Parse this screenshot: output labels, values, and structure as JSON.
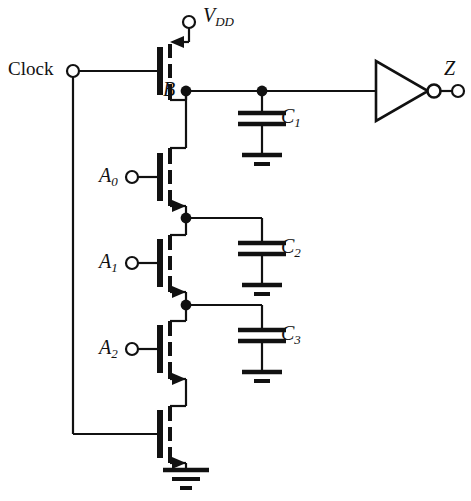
{
  "figure": {
    "type": "schematic",
    "background_color": "#ffffff",
    "line_color": "#111111"
  },
  "terminals": [
    {
      "id": "vdd",
      "label": "V",
      "subscript": "DD",
      "kind": "supply-terminal",
      "x": 189,
      "y": 22,
      "label_x": 203,
      "label_y": 6
    },
    {
      "id": "clock",
      "label": "Clock",
      "subscript": "",
      "kind": "input-terminal",
      "x": 73,
      "y": 71,
      "label_x": 8,
      "label_y": 59
    },
    {
      "id": "a0",
      "label": "A",
      "subscript": "0",
      "kind": "input-terminal",
      "x": 132,
      "y": 177,
      "label_x": 99,
      "label_y": 165
    },
    {
      "id": "a1",
      "label": "A",
      "subscript": "1",
      "kind": "input-terminal",
      "x": 132,
      "y": 263,
      "label_x": 99,
      "label_y": 251
    },
    {
      "id": "a2",
      "label": "A",
      "subscript": "2",
      "kind": "input-terminal",
      "x": 132,
      "y": 349,
      "label_x": 99,
      "label_y": 337
    },
    {
      "id": "z",
      "label": "Z",
      "subscript": "",
      "kind": "output-terminal",
      "x": 458,
      "y": 91,
      "label_x": 444,
      "label_y": 60
    }
  ],
  "nodes": [
    {
      "id": "node-b",
      "label": "B",
      "x": 186,
      "y": 91,
      "label_x": 164,
      "label_y": 80
    },
    {
      "id": "node-c1-tap",
      "label": "",
      "x": 262,
      "y": 91
    },
    {
      "id": "node-n1",
      "label": "",
      "x": 186,
      "y": 218
    },
    {
      "id": "node-n2",
      "label": "",
      "x": 186,
      "y": 305
    }
  ],
  "transistors": [
    {
      "id": "m-precharge",
      "type": "PMOS",
      "gate_net": "Clock",
      "drain_net": "VDD",
      "source_net": "B",
      "gate_bar_x": 160,
      "gate_center_y": 71,
      "arrow_direction": "into-device-top"
    },
    {
      "id": "m-a0",
      "type": "NMOS",
      "gate_net": "A0",
      "drain_net": "B",
      "source_net": "N1",
      "gate_bar_x": 160,
      "gate_center_y": 177,
      "arrow_direction": "out-of-device-bottom"
    },
    {
      "id": "m-a1",
      "type": "NMOS",
      "gate_net": "A1",
      "drain_net": "N1",
      "source_net": "N2",
      "gate_bar_x": 160,
      "gate_center_y": 263,
      "arrow_direction": "out-of-device-bottom"
    },
    {
      "id": "m-a2",
      "type": "NMOS",
      "gate_net": "A2",
      "drain_net": "N2",
      "source_net": "N3",
      "gate_bar_x": 160,
      "gate_center_y": 349,
      "arrow_direction": "out-of-device-bottom"
    },
    {
      "id": "m-footer",
      "type": "NMOS",
      "gate_net": "Clock",
      "drain_net": "N3",
      "source_net": "GND",
      "gate_bar_x": 160,
      "gate_center_y": 434,
      "arrow_direction": "out-of-device-bottom"
    }
  ],
  "capacitors": [
    {
      "id": "c1",
      "label": "C",
      "subscript": "1",
      "x": 262,
      "plate_top_y": 113,
      "plate_bottom_y": 124,
      "ground_y": 155,
      "label_x": 279,
      "label_y": 107
    },
    {
      "id": "c2",
      "label": "C",
      "subscript": "2",
      "x": 262,
      "plate_top_y": 243,
      "plate_bottom_y": 254,
      "ground_y": 285,
      "label_x": 279,
      "label_y": 238
    },
    {
      "id": "c3",
      "label": "C",
      "subscript": "3",
      "x": 262,
      "plate_top_y": 330,
      "plate_bottom_y": 341,
      "ground_y": 372,
      "label_x": 279,
      "label_y": 325
    }
  ],
  "gates": [
    {
      "id": "output-inverter",
      "kind": "inverter",
      "input_x": 376,
      "apex_x": 428,
      "center_y": 91,
      "half_height": 30,
      "bubble_cx": 434,
      "bubble_r": 6
    }
  ],
  "grounds": [
    {
      "id": "gnd-c1",
      "x": 262,
      "y": 155
    },
    {
      "id": "gnd-c2",
      "x": 262,
      "y": 285
    },
    {
      "id": "gnd-c3",
      "x": 262,
      "y": 372
    },
    {
      "id": "gnd-footer",
      "x": 186,
      "y": 470
    }
  ],
  "wires": {
    "clock_rail_x": 73,
    "clock_rail_bottom_y": 434,
    "drain_column_x": 186,
    "cap_column_x": 262,
    "output_wire_y": 91
  }
}
